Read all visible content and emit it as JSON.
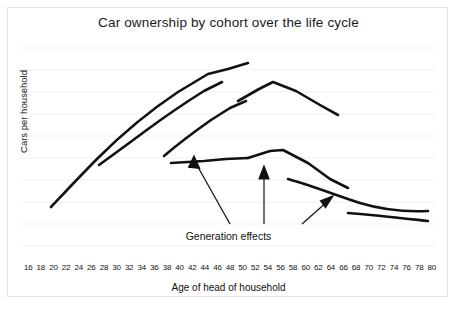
{
  "chart_data": {
    "type": "line",
    "title": "Car ownership by cohort over the life cycle",
    "xlabel": "Age of head of household",
    "ylabel": "Cars per household",
    "xlim": [
      16,
      80
    ],
    "ylim": [
      0,
      1
    ],
    "grid": true,
    "legend": false,
    "x_tick_labels": [
      "16",
      "18",
      "20",
      "22",
      "24",
      "26",
      "28",
      "30",
      "32",
      "34",
      "36",
      "38",
      "40",
      "42",
      "44",
      "46",
      "48",
      "50",
      "52",
      "54",
      "56",
      "58",
      "60",
      "62",
      "64",
      "66",
      "68",
      "70",
      "72",
      "74",
      "76",
      "78",
      "80"
    ],
    "y_tick_labels": [],
    "annotations": [
      {
        "text": "Generation effects",
        "x": 49,
        "y": 0.06,
        "arrow_count": 3,
        "arrow_targets": [
          {
            "x": 41,
            "y": 0.47
          },
          {
            "x": 53,
            "y": 0.4
          },
          {
            "x": 62,
            "y": 0.26
          }
        ]
      }
    ],
    "series": [
      {
        "name": "Cohort 1 (earliest born)",
        "description": "Highest peak; rises from age 18 to peak near age 47 then declines",
        "x": [
          18,
          24,
          30,
          36,
          42,
          47,
          51
        ],
        "values": [
          0.21,
          0.37,
          0.52,
          0.66,
          0.81,
          0.9,
          0.86
        ]
      },
      {
        "name": "Cohort 2",
        "description": "Starts later and lower; peaks near age 50",
        "x": [
          27,
          33,
          39,
          45,
          50,
          58,
          62
        ],
        "values": [
          0.34,
          0.47,
          0.6,
          0.71,
          0.79,
          0.65,
          0.61
        ]
      },
      {
        "name": "Cohort 3",
        "description": "Begins near age 38, peaks around age 50",
        "x": [
          38,
          42,
          46,
          50
        ],
        "values": [
          0.44,
          0.52,
          0.6,
          0.67
        ]
      },
      {
        "name": "Cohort 4",
        "description": "Flat rise then decline; peaks near age 57",
        "x": [
          50,
          57,
          64,
          72
        ],
        "values": [
          0.42,
          0.46,
          0.38,
          0.29
        ]
      },
      {
        "name": "Cohort 5",
        "description": "Shallow decline from age 58 onward",
        "x": [
          58,
          66,
          74,
          80
        ],
        "values": [
          0.3,
          0.24,
          0.19,
          0.18
        ]
      },
      {
        "name": "Cohort 6 (latest born)",
        "description": "Lowest, nearly flat segment at the oldest ages",
        "x": [
          66,
          74,
          80
        ],
        "values": [
          0.14,
          0.12,
          0.11
        ]
      }
    ]
  }
}
